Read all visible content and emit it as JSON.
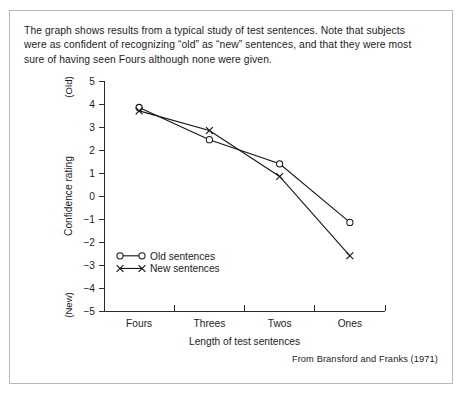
{
  "figure": {
    "caption": "The graph shows results from a typical study of test sentences. Note that subjects were as confident of recognizing “old” as “new” sentences, and that they were most sure of having seen Fours although none were given.",
    "attribution": "From Bransford and Franks (1971)",
    "border_color": "#b9b9b9",
    "ink_color": "#151515"
  },
  "chart_data": {
    "type": "line",
    "title": "",
    "xlabel": "Length of test sentences",
    "ylabel": "Confidence rating",
    "categories": [
      "Fours",
      "Threes",
      "Twos",
      "Ones"
    ],
    "ylim": [
      -5,
      5
    ],
    "yticks": [
      5,
      4,
      3,
      2,
      1,
      0,
      -1,
      -2,
      -3,
      -4,
      -5
    ],
    "ytick_labels": [
      "5",
      "4",
      "3",
      "2",
      "1",
      "0",
      "−1",
      "−2",
      "−3",
      "−4",
      "−5"
    ],
    "y_pole_high": "(Old)",
    "y_pole_low": "(New)",
    "grid": false,
    "legend_position": "inside-lower-left",
    "series": [
      {
        "name": "Old sentences",
        "marker": "open-circle",
        "values": [
          3.85,
          2.45,
          1.4,
          -1.15
        ]
      },
      {
        "name": "New sentences",
        "marker": "cross",
        "values": [
          3.7,
          2.85,
          0.85,
          -2.6
        ]
      }
    ]
  },
  "legend": {
    "items": [
      {
        "label": "Old sentences",
        "marker": "open-circle"
      },
      {
        "label": "New sentences",
        "marker": "cross"
      }
    ]
  }
}
